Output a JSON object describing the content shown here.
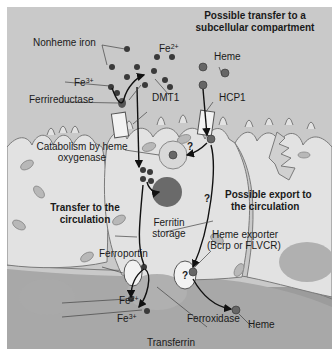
{
  "figure": {
    "title_line1": "Possible transfer to a",
    "title_line2": "subcellular compartment",
    "labels": {
      "nonheme_iron": "Nonheme iron",
      "fe3_base": "Fe",
      "fe3_sup": "3+",
      "fe2_top_base": "Fe",
      "fe2_top_sup": "2+",
      "heme_top": "Heme",
      "ferrireductase": "Ferrireductase",
      "dmt1": "DMT1",
      "hcp1": "HCP1",
      "catabolism_line1": "Catabolism by heme",
      "catabolism_line2": "oxygenase",
      "transfer_line1": "Transfer to the",
      "transfer_line2": "circulation",
      "ferritin_line1": "Ferritin",
      "ferritin_line2": "storage",
      "possible_export_line1": "Possible export to",
      "possible_export_line2": "the circulation",
      "heme_exporter_line1": "Heme exporter",
      "heme_exporter_line2": "(Bcrp or FLVCR)",
      "ferroportin": "Ferroportin",
      "fe2_bottom_base": "Fe",
      "fe2_bottom_sup": "2+",
      "fe3_bottom_base": "Fe",
      "fe3_bottom_sup": "3+",
      "ferroxidase": "Ferroxidase",
      "heme_bottom": "Heme",
      "transferrin": "Transferrin",
      "question_mark": "?"
    },
    "colors": {
      "background": "#c9c9c9",
      "cell_fill": "#e2e2e2",
      "cell_outline": "#7a7a7a",
      "lumen_bottom": "#9a9a9a",
      "nucleus": "#a9a9a9",
      "iron_dot": "#3a3a3a",
      "arrow": "#111111",
      "transporter": "#f2f2f2"
    }
  }
}
